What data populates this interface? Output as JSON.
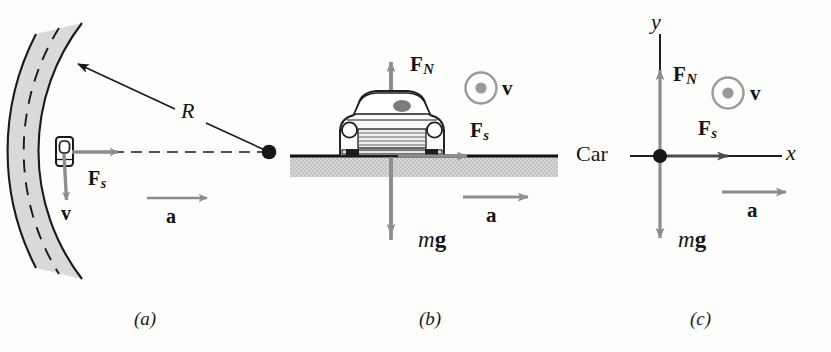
{
  "figure": {
    "colors": {
      "ink": "#151515",
      "gray_vector": "#8d8d8d",
      "road_fill": "#d9d9d9",
      "ground_fill": "#cfcfcf",
      "background": "#fdfdfc"
    }
  },
  "panels": [
    {
      "id": "a",
      "caption": "(a)",
      "view": "overhead view of car on curved road",
      "labels": {
        "radius": "R",
        "friction_force": {
          "base": "F",
          "sub": "s"
        },
        "velocity": "v",
        "acceleration": "a"
      },
      "elements": {
        "road": "curved two-lane road band with dashed center line",
        "center_dot": "center of curvature",
        "radius_line": "line from center of curvature to road",
        "car": "small overhead car icon on road"
      }
    },
    {
      "id": "b",
      "caption": "(b)",
      "view": "rear view of car on level ground",
      "labels": {
        "normal_force": {
          "base": "F",
          "sub": "N"
        },
        "friction_force": {
          "base": "F",
          "sub": "s"
        },
        "weight": {
          "italic": "m",
          "bold": "g"
        },
        "velocity": "v",
        "acceleration": "a"
      },
      "elements": {
        "ground": "horizontal ground line with hatched fill below",
        "car": "front view of car",
        "velocity_symbol": "circle-with-dot (out of page)"
      }
    },
    {
      "id": "c",
      "caption": "(c)",
      "view": "free-body diagram with x-y axes",
      "labels": {
        "origin": "Car",
        "x_axis": "x",
        "y_axis": "y",
        "normal_force": {
          "base": "F",
          "sub": "N"
        },
        "friction_force": {
          "base": "F",
          "sub": "s"
        },
        "weight": {
          "italic": "m",
          "bold": "g"
        },
        "velocity": "v",
        "acceleration": "a"
      },
      "elements": {
        "origin_dot": "particle representing the car",
        "velocity_symbol": "circle-with-dot (out of page)"
      }
    }
  ]
}
